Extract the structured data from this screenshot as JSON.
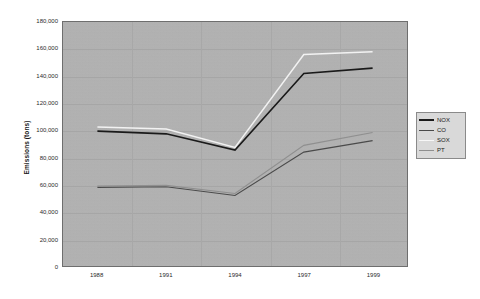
{
  "chart_data": {
    "type": "line",
    "title": "",
    "xlabel": "",
    "ylabel": "Emissions (tons)",
    "categories": [
      "1988",
      "1991",
      "1994",
      "1997",
      "1999"
    ],
    "x_positions": [
      1988,
      1991,
      1994,
      1997,
      1999
    ],
    "ylim": [
      0,
      180000
    ],
    "y_ticks": [
      "0",
      "20,000",
      "40,000",
      "60,000",
      "80,000",
      "100,000",
      "120,000",
      "140,000",
      "160,000",
      "180,000"
    ],
    "y_tick_values": [
      0,
      20000,
      40000,
      60000,
      80000,
      100000,
      120000,
      140000,
      160000,
      180000
    ],
    "grid": true,
    "legend_position": "right",
    "series": [
      {
        "name": "NOX",
        "color": "#1a1a1a",
        "width": 1.6,
        "values": [
          99500,
          97500,
          85500,
          142000,
          146000
        ]
      },
      {
        "name": "CO",
        "color": "#4a4a4a",
        "width": 1.1,
        "values": [
          58000,
          58500,
          52000,
          84000,
          92500
        ]
      },
      {
        "name": "SOX",
        "color": "#f2f2f2",
        "width": 1.5,
        "values": [
          102500,
          101000,
          87500,
          156000,
          158000
        ]
      },
      {
        "name": "PT",
        "color": "#8f8f8f",
        "width": 1.1,
        "values": [
          59000,
          59500,
          53500,
          89000,
          98500
        ]
      }
    ]
  },
  "legend": {
    "entries": [
      {
        "label": "NOX",
        "color": "#1a1a1a",
        "width": "2.4px"
      },
      {
        "label": "CO",
        "color": "#4a4a4a",
        "width": "1.2px"
      },
      {
        "label": "SOX",
        "color": "#f7f7f7",
        "width": "1.4px"
      },
      {
        "label": "PT",
        "color": "#8f8f8f",
        "width": "1.2px"
      }
    ]
  },
  "axes": {
    "y_title": "Emissions (tons)"
  },
  "colors": {
    "plot_background": "#b3b3b3",
    "page_background": "#ffffff",
    "grid": "#a6a6a6",
    "axis_border": "#6e6e6e",
    "legend_background": "#d9d9d9"
  }
}
